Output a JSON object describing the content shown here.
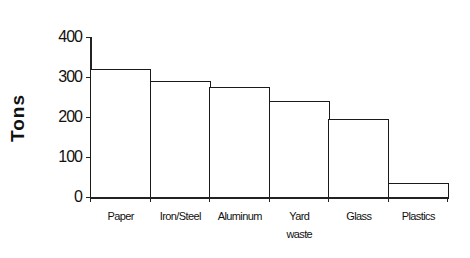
{
  "chart_data": {
    "type": "bar",
    "title": "",
    "xlabel": "",
    "ylabel": "Tons",
    "categories": [
      "Paper",
      "Iron/Steel",
      "Aluminum",
      "Yard waste",
      "Glass",
      "Plastics"
    ],
    "category_labels": [
      [
        "Paper"
      ],
      [
        "Iron/Steel"
      ],
      [
        "Aluminum"
      ],
      [
        "Yard",
        "waste"
      ],
      [
        "Glass"
      ],
      [
        "Plastics"
      ]
    ],
    "values": [
      320,
      290,
      275,
      240,
      195,
      35
    ],
    "ylim": [
      0,
      400
    ],
    "yticks": [
      "0",
      "100",
      "200",
      "300",
      "400"
    ],
    "grid": false,
    "legend": null,
    "bar_fill": "#ffffff",
    "bar_edge": "#1a1a1a"
  }
}
